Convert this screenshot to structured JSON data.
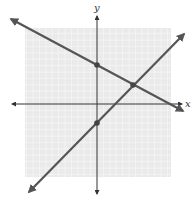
{
  "chart_data": {
    "type": "line",
    "title": "",
    "xlabel": "x",
    "ylabel": "y",
    "grid": true,
    "xlim": [
      -11,
      11
    ],
    "ylim": [
      -11,
      11
    ],
    "series": [
      {
        "name": "line-1",
        "equation": "y = -x/2 + 6",
        "slope": -0.5,
        "intercept": 6,
        "color": "#555555",
        "x": [
          -13.5,
          13.5
        ],
        "y": [
          12.75,
          -0.75
        ]
      },
      {
        "name": "line-2",
        "equation": "y = x - 3",
        "slope": 1,
        "intercept": -3,
        "color": "#555555",
        "x": [
          -10.6,
          13.6
        ],
        "y": [
          -13.6,
          10.6
        ]
      }
    ],
    "points": [
      {
        "label": "y-intercept line 1",
        "x": 0,
        "y": 6
      },
      {
        "label": "y-intercept line 2",
        "x": 0,
        "y": -3
      },
      {
        "label": "intersection",
        "x": 6,
        "y": 3
      }
    ]
  },
  "colors": {
    "grid_bg": "#eaeaea",
    "grid_line": "#f7f7f7",
    "axis": "#333333",
    "line": "#555555",
    "point": "#444444"
  },
  "labels": {
    "x_axis": "x",
    "y_axis": "y"
  }
}
